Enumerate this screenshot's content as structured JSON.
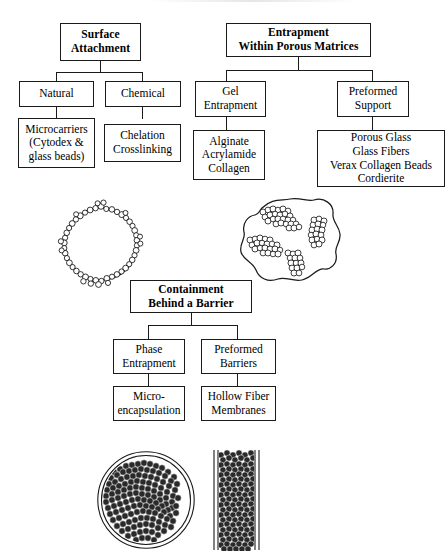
{
  "figure": {
    "background_color": "#ffffff",
    "line_color": "#1a1a1a"
  },
  "branches": {
    "surface_attachment": {
      "root": {
        "label": "Surface\nAttachment",
        "bold": true
      },
      "children": [
        {
          "label": "Natural",
          "leaf": {
            "label": "Microcarriers\n(Cytodex  &\nglass beads)"
          }
        },
        {
          "label": "Chemical",
          "leaf": {
            "label": "Chelation\nCrosslinking"
          }
        }
      ]
    },
    "entrapment": {
      "root": {
        "label": "Entrapment\nWithin Porous Matrices",
        "bold": true
      },
      "children": [
        {
          "label": "Gel\nEntrapment",
          "leaf": {
            "label": "Alginate\nAcrylamide\nCollagen"
          }
        },
        {
          "label": "Preformed\nSupport",
          "leaf": {
            "label": "Porous Glass\nGlass Fibers\nVerax Collagen Beads\nCordierite"
          }
        }
      ]
    },
    "containment": {
      "root": {
        "label": "Containment\nBehind a Barrier",
        "bold": true
      },
      "children": [
        {
          "label": "Phase\nEntrapment",
          "leaf": {
            "label": "Micro-\nencapsulation"
          }
        },
        {
          "label": "Preformed\nBarriers",
          "leaf": {
            "label": "Hollow Fiber\nMembranes"
          }
        }
      ]
    }
  },
  "illustrations": [
    {
      "name": "microcarrier-bead-illustration",
      "description": "circle ringed with small cells"
    },
    {
      "name": "porous-matrix-illustration",
      "description": "irregular blob with cell clusters inside"
    },
    {
      "name": "microcapsule-illustration",
      "description": "double-walled circle packed with cells"
    },
    {
      "name": "hollow-fiber-illustration",
      "description": "vertical tube packed with cells"
    }
  ]
}
